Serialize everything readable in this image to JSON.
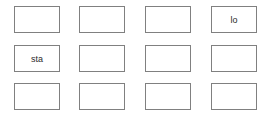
{
  "panel": {
    "name": "button-grid",
    "background_color": "#ffffff",
    "border_color": "#808080",
    "text_color": "#2b2b2b",
    "columns": 4,
    "rows": 3
  },
  "cells": [
    {
      "id": "cell-r1c1",
      "row": 1,
      "col": 1,
      "label": ""
    },
    {
      "id": "cell-r1c2",
      "row": 1,
      "col": 2,
      "label": ""
    },
    {
      "id": "cell-r1c3",
      "row": 1,
      "col": 3,
      "label": ""
    },
    {
      "id": "cell-r1c4",
      "row": 1,
      "col": 4,
      "label": "lo"
    },
    {
      "id": "cell-r2c1",
      "row": 2,
      "col": 1,
      "label": "sta"
    },
    {
      "id": "cell-r2c2",
      "row": 2,
      "col": 2,
      "label": ""
    },
    {
      "id": "cell-r2c3",
      "row": 2,
      "col": 3,
      "label": ""
    },
    {
      "id": "cell-r2c4",
      "row": 2,
      "col": 4,
      "label": ""
    },
    {
      "id": "cell-r3c1",
      "row": 3,
      "col": 1,
      "label": ""
    },
    {
      "id": "cell-r3c2",
      "row": 3,
      "col": 2,
      "label": ""
    },
    {
      "id": "cell-r3c3",
      "row": 3,
      "col": 3,
      "label": ""
    },
    {
      "id": "cell-r3c4",
      "row": 3,
      "col": 4,
      "label": ""
    }
  ]
}
